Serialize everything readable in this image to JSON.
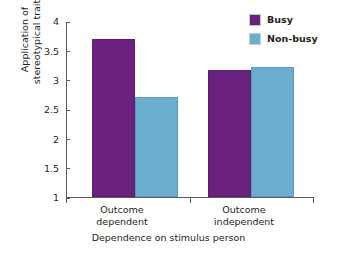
{
  "chart_data": {
    "type": "bar",
    "title": "",
    "xlabel": "Dependence on stimulus person",
    "ylabel": "Application of stereotypical traits",
    "ylabel_line1": "Application of",
    "ylabel_line2": "stereotypical traits",
    "categories": [
      "Outcome dependent",
      "Outcome independent"
    ],
    "category_lines": [
      [
        "Outcome",
        "dependent"
      ],
      [
        "Outcome",
        "independent"
      ]
    ],
    "series": [
      {
        "name": "Busy",
        "color": "#6B2180",
        "values": [
          3.7,
          3.17
        ]
      },
      {
        "name": "Non-busy",
        "color": "#6BAFD0",
        "values": [
          2.7,
          3.22
        ]
      }
    ],
    "ylim": [
      1,
      4
    ],
    "yticks": [
      1,
      1.5,
      2,
      2.5,
      3,
      3.5,
      4
    ],
    "ytick_labels": [
      "1",
      "1.5",
      "2",
      "2.5",
      "3",
      "3.5",
      "4"
    ],
    "grid": false,
    "legend_position": "top-right",
    "legend_entries": [
      "Busy",
      "Non-busy"
    ]
  },
  "legend": {
    "items": [
      {
        "label": "Busy",
        "color": "#6B2180"
      },
      {
        "label": "Non-busy",
        "color": "#6BAFD0"
      }
    ]
  },
  "axes": {
    "y_title_line1": "Application of",
    "y_title_line2": "stereotypical traits",
    "x_title": "Dependence on stimulus person",
    "y_tick_labels": [
      "4",
      "3.5",
      "3",
      "2.5",
      "2",
      "1.5",
      "1"
    ],
    "x_group_labels": [
      {
        "line1": "Outcome",
        "line2": "dependent"
      },
      {
        "line1": "Outcome",
        "line2": "independent"
      }
    ]
  },
  "colors": {
    "busy": "#6B2180",
    "non_busy": "#6BAFD0",
    "axis": "#58595b",
    "text": "#231f20",
    "background": "#ffffff"
  }
}
